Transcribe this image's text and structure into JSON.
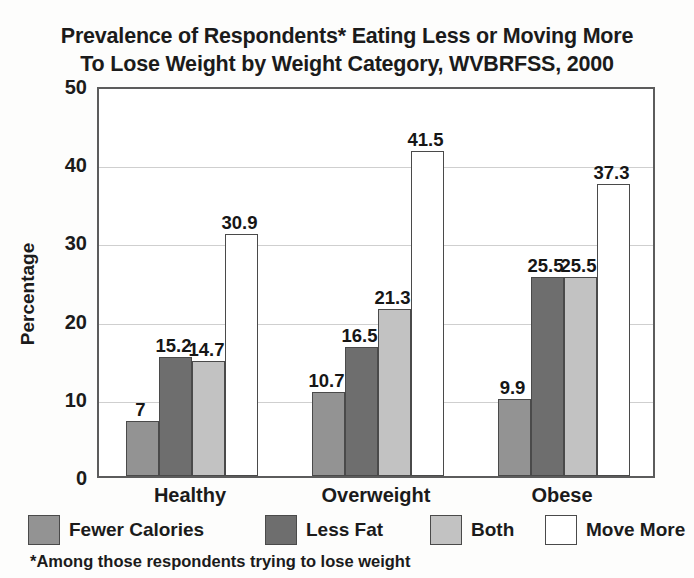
{
  "title": {
    "line1": "Prevalence of Respondents* Eating Less or Moving More",
    "line2": "To Lose Weight by Weight Category, WVBRFSS, 2000"
  },
  "axis": {
    "ylabel": "Percentage",
    "yticks": [
      "50",
      "40",
      "30",
      "20",
      "10",
      "0"
    ]
  },
  "footnote": "*Among those respondents trying to lose weight",
  "legend": [
    {
      "label": "Fewer Calories",
      "color": "#939393"
    },
    {
      "label": "Less Fat",
      "color": "#6e6e6e"
    },
    {
      "label": "Both",
      "color": "#c2c2c2"
    },
    {
      "label": "Move More",
      "color": "#ffffff"
    }
  ],
  "chart_data": {
    "type": "bar",
    "title": "Prevalence of Respondents* Eating Less or Moving More To Lose Weight by Weight Category, WVBRFSS, 2000",
    "xlabel": "",
    "ylabel": "Percentage",
    "ylim": [
      0,
      50
    ],
    "ytick_step": 10,
    "grid": true,
    "legend_position": "bottom",
    "categories": [
      "Healthy",
      "Overweight",
      "Obese"
    ],
    "series": [
      {
        "name": "Fewer Calories",
        "color": "#939393",
        "values": [
          7,
          10.7,
          9.9
        ],
        "labels": [
          "7",
          "10.7",
          "9.9"
        ]
      },
      {
        "name": "Less Fat",
        "color": "#6e6e6e",
        "values": [
          15.2,
          16.5,
          25.5
        ],
        "labels": [
          "15.2",
          "16.5",
          "25.5"
        ]
      },
      {
        "name": "Both",
        "color": "#c2c2c2",
        "values": [
          14.7,
          21.3,
          25.5
        ],
        "labels": [
          "14.7",
          "21.3",
          "25.5"
        ]
      },
      {
        "name": "Move More",
        "color": "#ffffff",
        "values": [
          30.9,
          41.5,
          37.3
        ],
        "labels": [
          "30.9",
          "41.5",
          "37.3"
        ]
      }
    ],
    "annotation": "*Among those respondents trying to lose weight"
  }
}
